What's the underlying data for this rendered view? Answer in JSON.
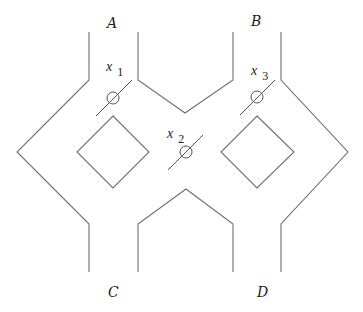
{
  "diagram": {
    "type": "flow-network",
    "colors": {
      "wall": "#6f6f6f",
      "valve": "#555555",
      "text": "#222222",
      "background": "#ffffff"
    },
    "terminals": [
      {
        "id": "A",
        "label": "A",
        "position": "top-left"
      },
      {
        "id": "B",
        "label": "B",
        "position": "top-right"
      },
      {
        "id": "C",
        "label": "C",
        "position": "bottom-left"
      },
      {
        "id": "D",
        "label": "D",
        "position": "bottom-right"
      }
    ],
    "valves": [
      {
        "id": "x1",
        "var": "x",
        "sub": "1",
        "location": "below A, between left loop and center"
      },
      {
        "id": "x2",
        "var": "x",
        "sub": "2",
        "location": "center crossing"
      },
      {
        "id": "x3",
        "var": "x",
        "sub": "3",
        "location": "below B, between center and right loop"
      }
    ],
    "islands": [
      {
        "id": "left-diamond",
        "shape": "diamond"
      },
      {
        "id": "right-diamond",
        "shape": "diamond"
      }
    ]
  }
}
